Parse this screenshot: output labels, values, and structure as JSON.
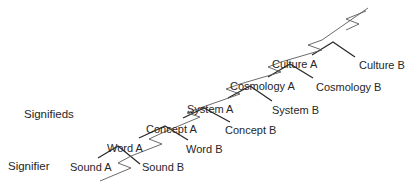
{
  "diagram": {
    "side_labels": {
      "signifieds": "Signifieds",
      "signifier": "Signifier"
    },
    "levels": [
      {
        "name": "sound",
        "a": "Sound A",
        "b": "Sound B"
      },
      {
        "name": "word",
        "a": "Word A",
        "b": "Word B"
      },
      {
        "name": "concept",
        "a": "Concept A",
        "b": "Concept B"
      },
      {
        "name": "system",
        "a": "System A",
        "b": "System B"
      },
      {
        "name": "cosmology",
        "a": "Cosmology A",
        "b": "Cosmology B"
      },
      {
        "name": "culture",
        "a": "Culture A",
        "b": "Culture B"
      }
    ],
    "colors": {
      "roof_line": "#2b2b2b",
      "zigzag_line": "#5a5a5a",
      "text": "#262626"
    }
  }
}
